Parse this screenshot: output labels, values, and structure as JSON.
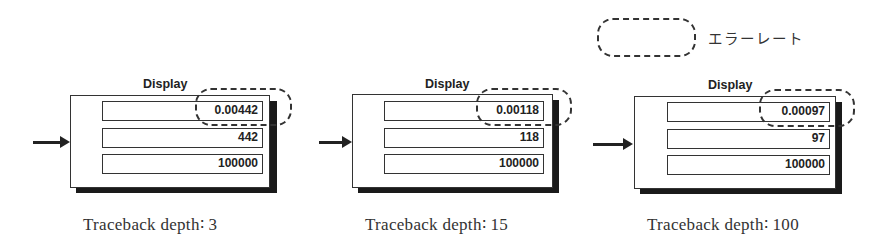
{
  "legend": {
    "icon": "dashed-rounded-outline",
    "label": "エラーレート"
  },
  "panels": [
    {
      "display_label": "Display",
      "error_rate": "0.00442",
      "error_count": "442",
      "total_bits": "100000",
      "caption": "Traceback depth∶ 3"
    },
    {
      "display_label": "Display",
      "error_rate": "0.00118",
      "error_count": "118",
      "total_bits": "100000",
      "caption": "Traceback depth∶ 15"
    },
    {
      "display_label": "Display",
      "error_rate": "0.00097",
      "error_count": "97",
      "total_bits": "100000",
      "caption": "Traceback depth∶ 100"
    }
  ]
}
